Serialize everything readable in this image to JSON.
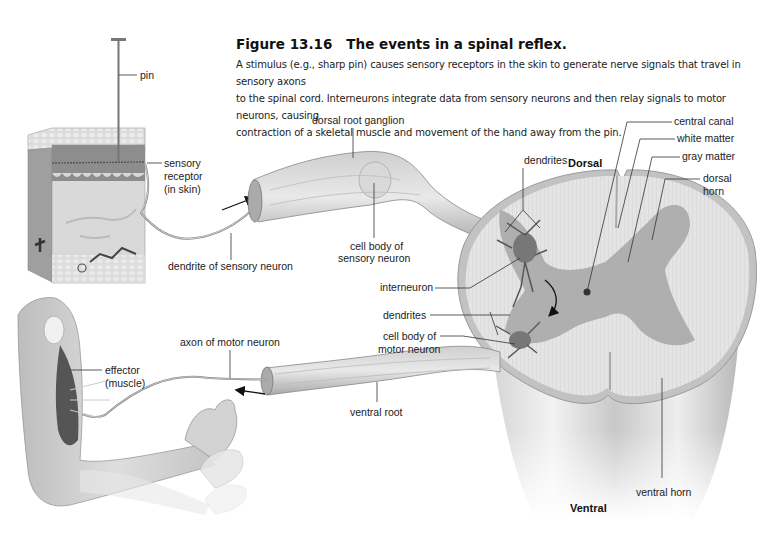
{
  "figure": {
    "number": "Figure 13.16",
    "title": "The events in a spinal reflex.",
    "caption_lines": [
      "A stimulus (e.g., sharp pin) causes sensory receptors in the skin to generate nerve signals that travel in sensory axons",
      "to the spinal cord. Interneurons integrate data from sensory neurons and then relay signals to motor neurons, causing",
      "contraction of a skeletal muscle and movement of the hand away from the pin."
    ]
  },
  "labels": {
    "pin": "pin",
    "sensory_receptor": [
      "sensory",
      "receptor",
      "(in skin)"
    ],
    "dendrite_of_sensory_neuron": "dendrite of sensory neuron",
    "dorsal_root_ganglion": "dorsal root ganglion",
    "cell_body_of_sensory_neuron": [
      "cell body of",
      "sensory neuron"
    ],
    "interneuron": "interneuron",
    "dendrites_upper": "dendrites",
    "dendrites_lower": "dendrites",
    "cell_body_of_motor_neuron": [
      "cell body of",
      "motor neuron"
    ],
    "axon_of_motor_neuron": "axon of motor neuron",
    "effector": [
      "effector",
      "(muscle)"
    ],
    "ventral_root": "ventral root",
    "dorsal": "Dorsal",
    "ventral": "Ventral",
    "central_canal": "central canal",
    "white_matter": "white matter",
    "gray_matter": "gray matter",
    "dorsal_horn": [
      "dorsal",
      "horn"
    ],
    "ventral_horn": "ventral horn"
  }
}
